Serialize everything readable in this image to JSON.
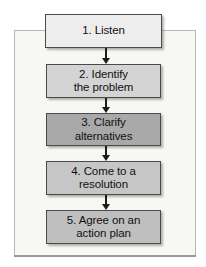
{
  "figure": {
    "type": "flowchart",
    "orientation": "vertical-top-to-bottom",
    "panel_background": "#f7f7f4",
    "panel_border": "#b9b9b4",
    "connector_color": "#1c1c1c",
    "node_border": "#4a4a4a",
    "text_color": "#111111"
  },
  "nodes": [
    {
      "step": "1",
      "label": "1. Listen",
      "lines": [
        "1. Listen"
      ],
      "fill": "#ededed"
    },
    {
      "step": "2",
      "label": "2. Identify the problem",
      "lines": [
        "2. Identify",
        "the problem"
      ],
      "fill": "#d4d4d4"
    },
    {
      "step": "3",
      "label": "3. Clarify alternatives",
      "lines": [
        "3. Clarify",
        "alternatives"
      ],
      "fill": "#a9a9a9"
    },
    {
      "step": "4",
      "label": "4. Come to a resolution",
      "lines": [
        "4. Come to a",
        "resolution"
      ],
      "fill": "#c6c6c6"
    },
    {
      "step": "5",
      "label": "5. Agree on an action plan",
      "lines": [
        "5. Agree on an",
        "action plan"
      ],
      "fill": "#bfbfbf"
    }
  ],
  "connectors": [
    {
      "from": "1",
      "to": "2",
      "glyph": "down-arrow"
    },
    {
      "from": "2",
      "to": "3",
      "glyph": "down-arrow"
    },
    {
      "from": "3",
      "to": "4",
      "glyph": "down-arrow"
    },
    {
      "from": "4",
      "to": "5",
      "glyph": "down-arrow"
    }
  ]
}
